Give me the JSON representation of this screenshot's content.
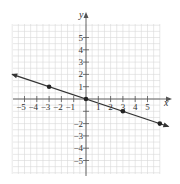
{
  "chart_data": {
    "type": "line",
    "title": "",
    "xlabel": "x",
    "ylabel": "y",
    "xlim": [
      -6,
      6
    ],
    "ylim": [
      -6,
      6
    ],
    "grid": true,
    "x_ticks": [
      -5,
      -4,
      -3,
      -2,
      -1,
      1,
      2,
      3,
      4,
      5
    ],
    "y_ticks": [
      5,
      4,
      3,
      2,
      1,
      -1,
      -2,
      -3,
      -4,
      -5
    ],
    "x_tick_labels": [
      "−5",
      "−4",
      "−3",
      "−2",
      "−1",
      "1",
      "2",
      "3",
      "4",
      "5"
    ],
    "y_tick_labels": [
      "5",
      "4",
      "3",
      "2",
      "1",
      "−2",
      "−3",
      "−4",
      "−5"
    ],
    "series": [
      {
        "name": "line",
        "equation": "y = -x/3",
        "slope": -0.3333,
        "intercept": 0,
        "arrows_both_ends": true,
        "points": [
          {
            "x": -3,
            "y": 1
          },
          {
            "x": 0,
            "y": 0
          },
          {
            "x": 3,
            "y": -1
          },
          {
            "x": 6,
            "y": -2
          }
        ]
      }
    ]
  }
}
